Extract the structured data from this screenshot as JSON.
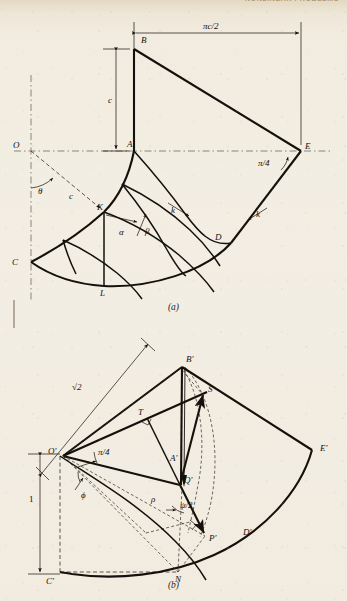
{
  "page": {
    "running_head": "NONLINEAR PROBLEMS",
    "background_color": "#f1ebe0",
    "ink_color": "#14100c"
  },
  "figures": [
    {
      "id": "fig-a",
      "caption": "(a)",
      "description": "Slip-line field / characteristic net for a curved plastic region",
      "labels": [
        {
          "name": "O",
          "text": "O",
          "x": 13,
          "y": 148,
          "style": "italic"
        },
        {
          "name": "A",
          "text": "A",
          "x": 133,
          "y": 148,
          "style": "italic"
        },
        {
          "name": "B",
          "text": "B",
          "x": 141,
          "y": 40,
          "style": "italic"
        },
        {
          "name": "C",
          "text": "C",
          "x": 10,
          "y": 262,
          "style": "italic"
        },
        {
          "name": "D",
          "text": "D",
          "x": 215,
          "y": 238,
          "style": "italic"
        },
        {
          "name": "E",
          "text": "E",
          "x": 304,
          "y": 148,
          "style": "italic"
        },
        {
          "name": "K",
          "text": "K",
          "x": 99,
          "y": 213,
          "style": "italic"
        },
        {
          "name": "L",
          "text": "L",
          "x": 102,
          "y": 288,
          "style": "italic"
        },
        {
          "name": "c-vert",
          "text": "c",
          "x": 111,
          "y": 103,
          "style": "italic"
        },
        {
          "name": "c-diag",
          "text": "c",
          "x": 69,
          "y": 198,
          "style": "italic"
        },
        {
          "name": "theta",
          "text": "θ",
          "x": 38,
          "y": 191,
          "style": "italic"
        },
        {
          "name": "alpha",
          "text": "α",
          "x": 120,
          "y": 232,
          "style": "italic"
        },
        {
          "name": "beta",
          "text": "β",
          "x": 146,
          "y": 231,
          "style": "italic"
        },
        {
          "name": "k-mid",
          "text": "k",
          "x": 172,
          "y": 212,
          "style": "italic"
        },
        {
          "name": "k-out",
          "text": "k",
          "x": 255,
          "y": 215,
          "style": "italic"
        },
        {
          "name": "pi-c-2",
          "text": "πc/2",
          "x": 212,
          "y": 30,
          "style": "italic"
        },
        {
          "name": "pi-4",
          "text": "π/4",
          "x": 263,
          "y": 163,
          "style": "italic"
        }
      ],
      "dimensions": [
        {
          "name": "width-pi-c-2",
          "label": "πc/2",
          "from": "A",
          "to": "E"
        },
        {
          "name": "height-c",
          "label": "c",
          "from": "A",
          "to": "B"
        }
      ]
    },
    {
      "id": "fig-b",
      "caption": "(b)",
      "description": "Unit-scaled hodograph construction with angles phi and psi/2",
      "labels": [
        {
          "name": "O-prime",
          "text": "O′",
          "x": 57,
          "y": 452,
          "style": "italic"
        },
        {
          "name": "A-prime",
          "text": "A′",
          "x": 180,
          "y": 458,
          "style": "italic"
        },
        {
          "name": "B-prime",
          "text": "B′",
          "x": 185,
          "y": 360,
          "style": "italic"
        },
        {
          "name": "C-prime",
          "text": "C′",
          "x": 52,
          "y": 573,
          "style": "italic"
        },
        {
          "name": "D-prime",
          "text": "D′",
          "x": 245,
          "y": 533,
          "style": "italic"
        },
        {
          "name": "E-prime",
          "text": "E′",
          "x": 322,
          "y": 450,
          "style": "italic"
        },
        {
          "name": "P-prime",
          "text": "P′",
          "x": 211,
          "y": 537,
          "style": "italic"
        },
        {
          "name": "Q-prime",
          "text": "Q′",
          "x": 184,
          "y": 479,
          "style": "italic"
        },
        {
          "name": "S",
          "text": "S",
          "x": 209,
          "y": 392,
          "style": "italic"
        },
        {
          "name": "T",
          "text": "T",
          "x": 139,
          "y": 415,
          "style": "italic"
        },
        {
          "name": "N",
          "text": "N",
          "x": 177,
          "y": 572,
          "style": "italic"
        },
        {
          "name": "sqrt-2",
          "text": "√2",
          "x": 77,
          "y": 387,
          "style": "italic"
        },
        {
          "name": "one",
          "text": "1",
          "x": 47,
          "y": 498,
          "style": "roman"
        },
        {
          "name": "rho",
          "text": "ρ",
          "x": 153,
          "y": 498,
          "style": "italic"
        },
        {
          "name": "phi",
          "text": "ϕ",
          "x": 83,
          "y": 480,
          "style": "italic"
        },
        {
          "name": "pi-4",
          "text": "π/4",
          "x": 94,
          "y": 452,
          "style": "italic"
        },
        {
          "name": "psi-2",
          "text": "ψ/2",
          "x": 182,
          "y": 506,
          "style": "italic"
        }
      ],
      "dimensions": [
        {
          "name": "diag-sqrt-2",
          "label": "√2",
          "from": "O′",
          "to": "B′"
        },
        {
          "name": "height-one",
          "label": "1",
          "from": "O′",
          "to": "C′"
        }
      ]
    }
  ]
}
